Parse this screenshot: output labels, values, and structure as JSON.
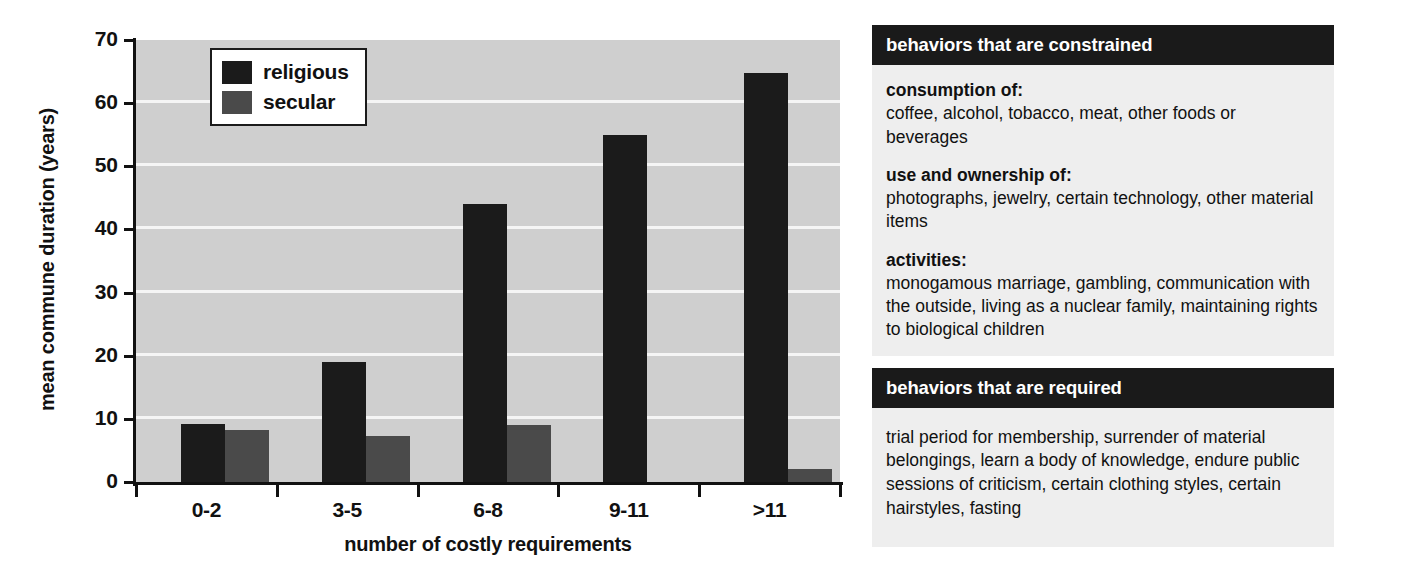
{
  "chart_data": {
    "type": "bar",
    "title": "",
    "xlabel": "number of costly requirements",
    "ylabel": "mean commune duration (years)",
    "categories": [
      "0-2",
      "3-5",
      "6-8",
      "9-11",
      ">11"
    ],
    "series": [
      {
        "name": "religious",
        "color": "#1b1b1b",
        "values": [
          9.2,
          19,
          44,
          55,
          64.7
        ]
      },
      {
        "name": "secular",
        "color": "#4a4a4a",
        "values": [
          8.3,
          7.3,
          9.1,
          0,
          2.1
        ]
      }
    ],
    "ylim": [
      0,
      70
    ],
    "yticks": [
      0,
      10,
      20,
      30,
      40,
      50,
      60,
      70
    ],
    "ytick_labels": [
      "0",
      "10",
      "20",
      "30",
      "40",
      "50",
      "60",
      "70"
    ],
    "grid": "horizontal",
    "legend_position": "top-left",
    "plot_background": "#cfcfcf",
    "gridline_color": "#f5f5f5"
  },
  "legend": {
    "items": [
      {
        "label": "religious"
      },
      {
        "label": "secular"
      }
    ]
  },
  "side_panel": {
    "constrained": {
      "header": "behaviors that are constrained",
      "entries": [
        {
          "term": "consumption of:",
          "desc": "coffee, alcohol, tobacco, meat, other foods or beverages"
        },
        {
          "term": "use and ownership of:",
          "desc": "photographs, jewelry, certain technology, other material items"
        },
        {
          "term": "activities:",
          "desc": "monogamous marriage, gambling, communication with the outside, living as a nuclear family, maintaining rights to biological children"
        }
      ]
    },
    "required": {
      "header": "behaviors that are required",
      "text": "trial period for membership, surrender of material belongings, learn a body of knowledge, endure public sessions of criticism, certain clothing styles, certain hairstyles, fasting"
    }
  }
}
